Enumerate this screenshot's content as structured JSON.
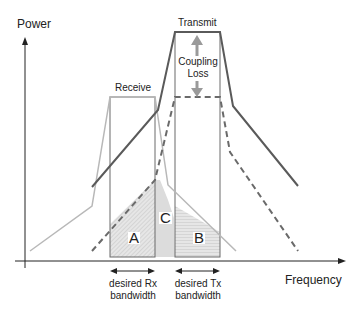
{
  "diagram": {
    "y_axis_label": "Power",
    "x_axis_label": "Frequency",
    "receive_label": "Receive",
    "transmit_label": "Transmit",
    "coupling_loss_line1": "Coupling",
    "coupling_loss_line2": "Loss",
    "region_a": "A",
    "region_b": "B",
    "region_c": "C",
    "rx_bw_line1": "desired Rx",
    "rx_bw_line2": "bandwidth",
    "tx_bw_line1": "desired Tx",
    "tx_bw_line2": "bandwidth"
  },
  "colors": {
    "transmit_curve": "#5a5a5a",
    "receive_curve": "#b8b8b8",
    "coupled_dashed": "#6a6a6a",
    "fill_hatch": "#d4d4d4",
    "arrow": "#9a9a9a"
  }
}
